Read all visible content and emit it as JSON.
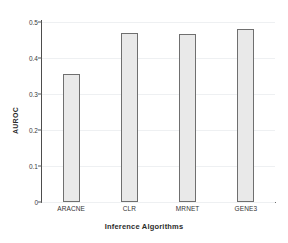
{
  "chart_data": {
    "type": "bar",
    "title": "",
    "xlabel": "Inference Algorithms",
    "ylabel": "AUROC",
    "categories": [
      "ARACNE",
      "CLR",
      "MRNET",
      "GENE3"
    ],
    "values": [
      0.355,
      0.47,
      0.468,
      0.48
    ],
    "ylim": [
      0,
      0.5
    ],
    "yticks": [
      0,
      0.1,
      0.2,
      0.3,
      0.4,
      0.5
    ],
    "ytick_labels": [
      "0",
      "0.1",
      "0.2",
      "0.3",
      "0.4",
      "0.5"
    ],
    "grid": true,
    "grid_axis": "y",
    "legend": false,
    "legend_position": "none",
    "bar_fill_color": "#e9e9e9",
    "bar_edge_color": "#6f6f6f",
    "axis_color": "#4d4d4d",
    "gridline_color": "#eef0f2",
    "background_color": "#ffffff"
  }
}
